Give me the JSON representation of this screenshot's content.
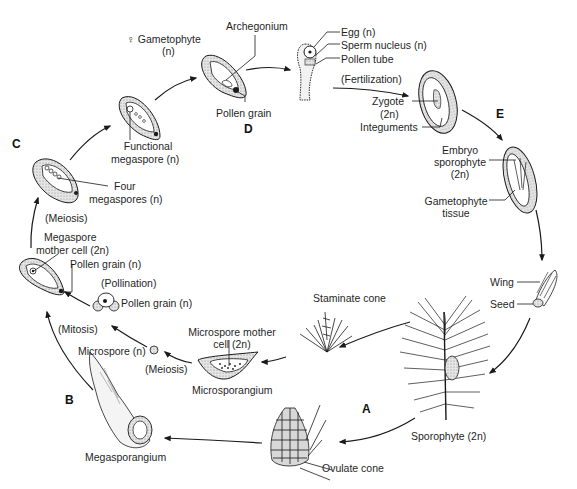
{
  "diagram": {
    "stages": {
      "A": "A",
      "B": "B",
      "C": "C",
      "D": "D",
      "E": "E"
    },
    "labels": {
      "female_gametophyte": "♀ Gametophyte",
      "female_gametophyte_ploidy": "(n)",
      "archegonium": "Archegonium",
      "pollen_grain_d": "Pollen grain",
      "egg": "Egg (n)",
      "sperm_nucleus": "Sperm nucleus (n)",
      "pollen_tube": "Pollen tube",
      "fertilization": "(Fertilization)",
      "zygote": "Zygote",
      "zygote_ploidy": "(2n)",
      "integuments": "Integuments",
      "functional_megaspore_1": "Functional",
      "functional_megaspore_2": "megaspore (n)",
      "four_megaspores_1": "Four",
      "four_megaspores_2": "megaspores (n)",
      "meiosis_female": "(Meiosis)",
      "megaspore_mother_cell_1": "Megaspore",
      "megaspore_mother_cell_2": "mother cell (2n)",
      "pollen_grain_n_1": "Pollen grain (n)",
      "pollination": "(Pollination)",
      "pollen_grain_n_2": "Pollen grain (n)",
      "mitosis": "(Mitosis)",
      "microspore": "Microspore (n)",
      "meiosis_male": "(Meiosis)",
      "microspore_mother_cell_1": "Microspore mother",
      "microspore_mother_cell_2": "cell (2n)",
      "microsporangium": "Microsporangium",
      "staminate_cone": "Staminate cone",
      "megasporangium": "Megasporangium",
      "ovulate_cone": "Ovulate cone",
      "sporophyte": "Sporophyte (2n)",
      "embryo_sporophyte_1": "Embryo",
      "embryo_sporophyte_2": "sporophyte",
      "embryo_sporophyte_3": "(2n)",
      "gametophyte_tissue_1": "Gametophyte",
      "gametophyte_tissue_2": "tissue",
      "wing": "Wing",
      "seed": "Seed"
    },
    "colors": {
      "ink": "#1a1a1a",
      "stipple": "#bdbdbd",
      "background": "#ffffff"
    }
  }
}
